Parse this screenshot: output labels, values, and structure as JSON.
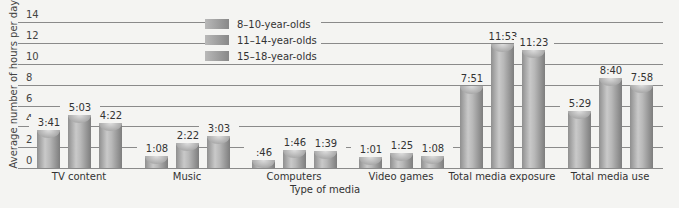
{
  "chart_data": {
    "type": "bar",
    "title": "",
    "xlabel": "Type of media",
    "ylabel": "Average number of hours per day",
    "ylim": [
      0,
      14
    ],
    "yticks": [
      0,
      2,
      4,
      6,
      8,
      10,
      12,
      14
    ],
    "grid": true,
    "legend_position": "upper-left-inside",
    "categories": [
      "TV content",
      "Music",
      "Computers",
      "Video games",
      "Total media exposure",
      "Total media use"
    ],
    "series": [
      {
        "name": "8–10-year-olds",
        "labels": [
          "3:41",
          "1:08",
          ":46",
          "1:01",
          "7:51",
          "5:29"
        ],
        "values": [
          3.68,
          1.13,
          0.77,
          1.02,
          7.85,
          5.48
        ]
      },
      {
        "name": "11–14-year-olds",
        "labels": [
          "5:03",
          "2:22",
          "1:46",
          "1:25",
          "11:53",
          "8:40"
        ],
        "values": [
          5.05,
          2.37,
          1.77,
          1.42,
          11.88,
          8.67
        ]
      },
      {
        "name": "15–18-year-olds",
        "labels": [
          "4:22",
          "3:03",
          "1:39",
          "1:08",
          "11:23",
          "7:58"
        ],
        "values": [
          4.37,
          3.05,
          1.65,
          1.13,
          11.38,
          7.97
        ]
      }
    ]
  },
  "axis": {
    "ylabel": "Average number of hours per day",
    "xlabel": "Type of media",
    "ticks": [
      "0",
      "2",
      "4",
      "6",
      "8",
      "10",
      "12",
      "14"
    ]
  },
  "legend": [
    "8–10-year-olds",
    "11–14-year-olds",
    "15–18-year-olds"
  ],
  "categories": [
    "TV content",
    "Music",
    "Computers",
    "Video games",
    "Total media exposure",
    "Total media use"
  ]
}
